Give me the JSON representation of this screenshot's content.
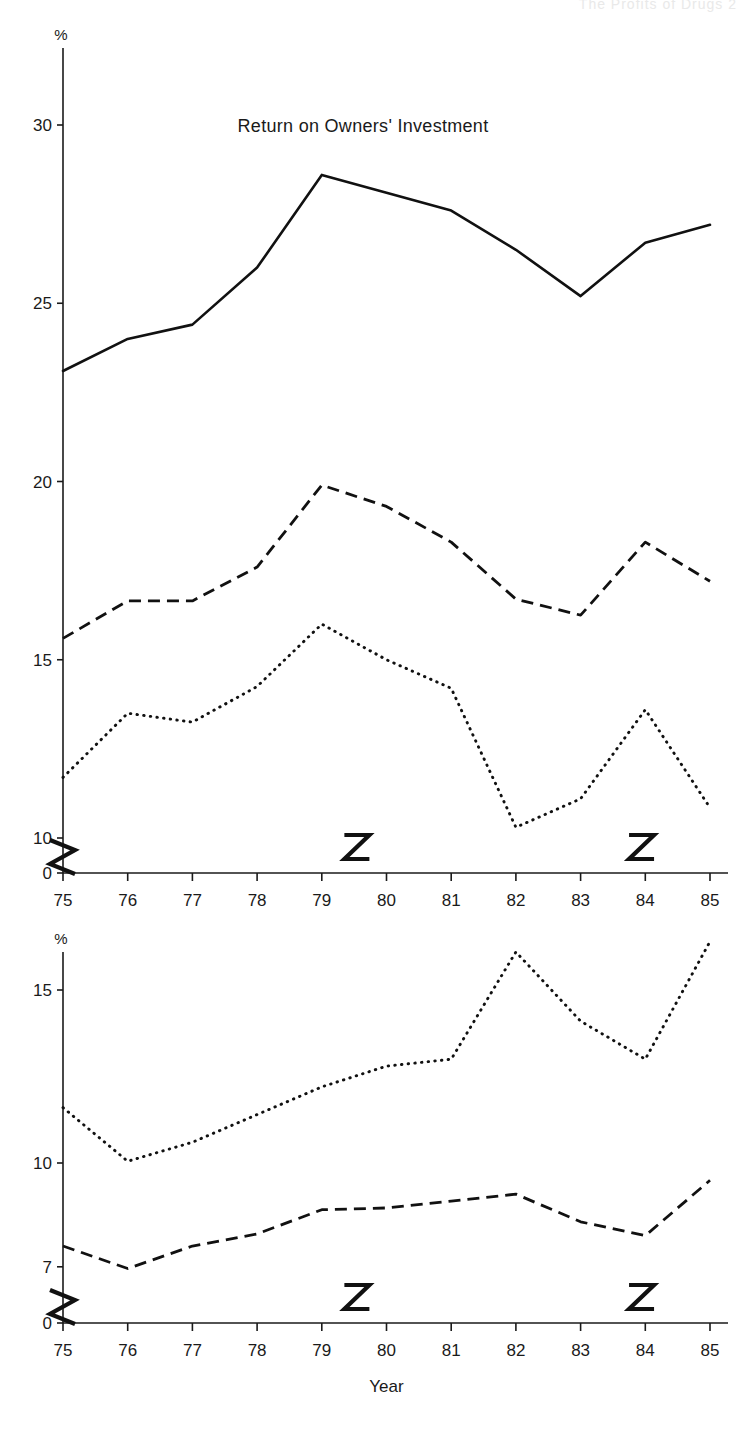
{
  "running_head": "The Profits of Drugs   2",
  "figures": [
    {
      "id": "figure-top",
      "title": "Return on Owners' Investment",
      "unit_label": "%",
      "xlabel": "Year",
      "y_ticks": [
        "30",
        "25",
        "20",
        "15",
        "10",
        "0"
      ],
      "x_ticks": [
        "75",
        "76",
        "77",
        "78",
        "79",
        "80",
        "81",
        "82",
        "83",
        "84",
        "85"
      ]
    },
    {
      "id": "figure-bottom",
      "title": "",
      "unit_label": "%",
      "xlabel": "Year",
      "y_ticks": [
        "15",
        "10",
        "7",
        "0"
      ],
      "x_ticks": [
        "75",
        "76",
        "77",
        "78",
        "79",
        "80",
        "81",
        "82",
        "83",
        "84",
        "85"
      ]
    }
  ],
  "chart_data": [
    {
      "type": "line",
      "title": "Return on Owners' Investment",
      "xlabel": "Year",
      "ylabel": "%",
      "grid": false,
      "legend": "none",
      "axis_break_y": true,
      "axis_break_x": true,
      "x": [
        "75",
        "76",
        "77",
        "78",
        "79",
        "80",
        "81",
        "82",
        "83",
        "84",
        "85"
      ],
      "ylim": [
        10,
        31
      ],
      "ytick_values": [
        30,
        25,
        20,
        15,
        10,
        0
      ],
      "series": [
        {
          "name": "solid",
          "style": "solid",
          "values": [
            23.1,
            24.0,
            24.4,
            26.0,
            28.6,
            28.1,
            27.6,
            26.5,
            25.2,
            26.7,
            27.2
          ]
        },
        {
          "name": "dashed",
          "style": "dashed",
          "values": [
            15.6,
            16.65,
            16.65,
            17.6,
            19.9,
            19.3,
            18.3,
            16.7,
            16.25,
            18.3,
            17.2
          ]
        },
        {
          "name": "dotted",
          "style": "dotted",
          "values": [
            11.7,
            13.5,
            13.25,
            14.25,
            16.0,
            15.0,
            14.2,
            10.3,
            11.1,
            13.6,
            10.85
          ]
        }
      ]
    },
    {
      "type": "line",
      "title": "",
      "xlabel": "Year",
      "ylabel": "%",
      "grid": false,
      "legend": "none",
      "axis_break_y": true,
      "axis_break_x": true,
      "x": [
        "75",
        "76",
        "77",
        "78",
        "79",
        "80",
        "81",
        "82",
        "83",
        "84",
        "85"
      ],
      "ylim": [
        7,
        16.6
      ],
      "ytick_values": [
        15,
        10,
        7,
        0
      ],
      "series": [
        {
          "name": "dotted",
          "style": "dotted",
          "values": [
            11.6,
            10.05,
            10.6,
            11.4,
            12.2,
            12.8,
            13.0,
            16.1,
            14.1,
            13.0,
            16.4
          ]
        },
        {
          "name": "dashed",
          "style": "dashed",
          "values": [
            7.6,
            6.95,
            7.6,
            7.95,
            8.65,
            8.7,
            8.9,
            9.1,
            8.3,
            7.9,
            9.5
          ]
        }
      ]
    }
  ]
}
